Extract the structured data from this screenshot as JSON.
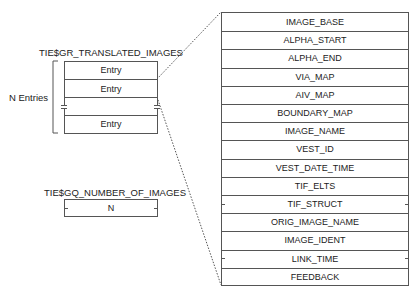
{
  "translated_images": {
    "title": "TIE$GR_TRANSLATED_IMAGES",
    "bracket_label": "N Entries",
    "entries": [
      "Entry",
      "Entry",
      "",
      "Entry"
    ]
  },
  "number_of_images": {
    "title": "TIE$GQ_NUMBER_OF_IMAGES",
    "value": "N"
  },
  "entry_structure": {
    "fields": [
      "IMAGE_BASE",
      "ALPHA_START",
      "ALPHA_END",
      "VIA_MAP",
      "AIV_MAP",
      "BOUNDARY_MAP",
      "IMAGE_NAME",
      "VEST_ID",
      "VEST_DATE_TIME",
      "TIF_ELTS",
      "TIF_STRUCT",
      "ORIG_IMAGE_NAME",
      "IMAGE_IDENT",
      "LINK_TIME",
      "FEEDBACK"
    ]
  }
}
